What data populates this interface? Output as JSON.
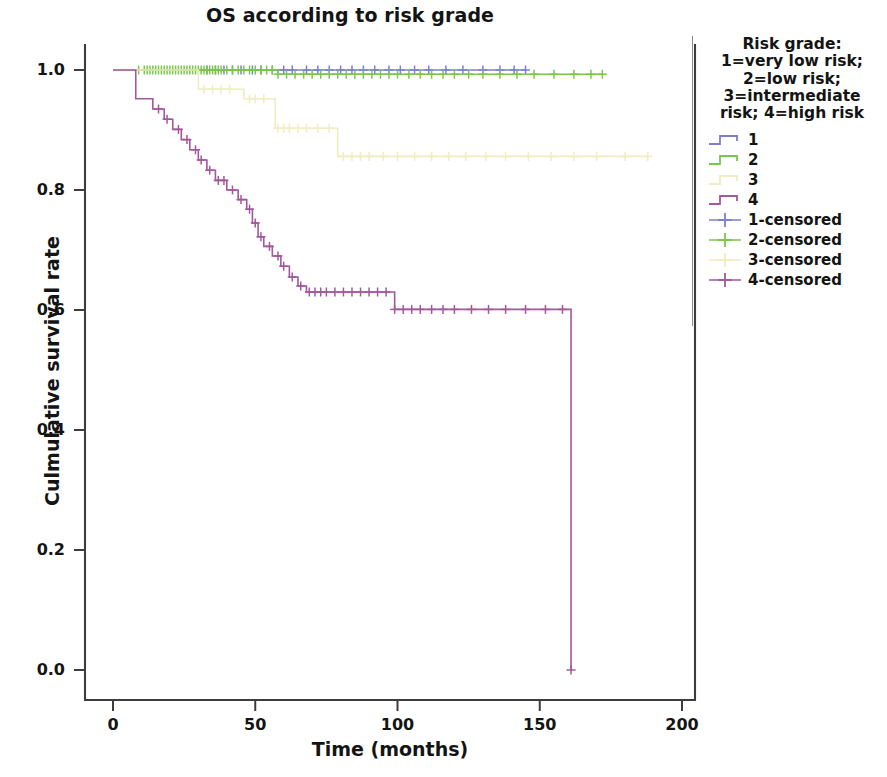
{
  "chart_data": {
    "type": "line",
    "subtype": "kaplan-meier-survival",
    "title": "OS according to risk grade",
    "xlabel": "Time (months)",
    "ylabel": "Culmulative survival rate",
    "xlim": [
      0,
      200
    ],
    "ylim": [
      0.0,
      1.0
    ],
    "xticks": [
      0,
      50,
      100,
      150,
      200
    ],
    "xtick_labels": [
      "0",
      "50",
      "100",
      "150",
      "200"
    ],
    "yticks": [
      0.0,
      0.2,
      0.4,
      0.6,
      0.8,
      1.0
    ],
    "ytick_labels": [
      "0.0",
      "0.2",
      "0.4",
      "0.6",
      "0.8",
      "1.0"
    ],
    "grid": false,
    "legend_position": "right",
    "legend_title": "Risk grade:\n1=very low risk;\n2=low risk;\n3=intermediate\nrisk; 4=high risk",
    "colors": {
      "group1": "#7b7fd0",
      "group2": "#79c64c",
      "group3": "#eeeec0",
      "group4": "#a2589b"
    },
    "series": [
      {
        "name": "1",
        "label": "1",
        "censored_label": "1-censored",
        "color": "#7b7fd0",
        "steps": [
          [
            0,
            1.0
          ],
          [
            145,
            1.0
          ]
        ],
        "censor_times": [
          33,
          36,
          39,
          42,
          45,
          49,
          52,
          56,
          60,
          63,
          68,
          72,
          76,
          80,
          84,
          88,
          92,
          97,
          101,
          106,
          111,
          117,
          123,
          130,
          136,
          141,
          145
        ]
      },
      {
        "name": "2",
        "label": "2",
        "censored_label": "2-censored",
        "color": "#79c64c",
        "steps": [
          [
            0,
            1.0
          ],
          [
            58,
            1.0
          ],
          [
            58,
            0.993
          ],
          [
            172,
            0.993
          ]
        ],
        "censor_times": [
          9,
          11,
          12,
          13,
          14,
          15,
          16,
          17,
          18,
          19,
          20,
          21,
          22,
          23,
          24,
          25,
          26,
          27,
          28,
          29,
          30,
          31,
          32,
          33,
          34,
          35,
          36,
          37,
          38,
          40,
          42,
          44,
          46,
          48,
          50,
          52,
          54,
          56,
          58,
          61,
          64,
          67,
          70,
          73,
          76,
          79,
          82,
          85,
          88,
          91,
          94,
          97,
          100,
          104,
          108,
          112,
          116,
          120,
          125,
          130,
          136,
          142,
          148,
          155,
          162,
          168,
          172
        ]
      },
      {
        "name": "3",
        "label": "3",
        "censored_label": "3-censored",
        "color": "#eeeec0",
        "steps": [
          [
            0,
            1.0
          ],
          [
            30,
            1.0
          ],
          [
            30,
            0.968
          ],
          [
            46,
            0.968
          ],
          [
            46,
            0.952
          ],
          [
            57,
            0.952
          ],
          [
            57,
            0.903
          ],
          [
            79,
            0.903
          ],
          [
            79,
            0.856
          ],
          [
            188,
            0.856
          ]
        ],
        "censor_times": [
          32,
          35,
          38,
          41,
          48,
          50,
          53,
          58,
          60,
          62,
          65,
          68,
          72,
          76,
          81,
          84,
          87,
          90,
          95,
          100,
          106,
          112,
          118,
          124,
          131,
          138,
          146,
          154,
          162,
          170,
          180,
          188
        ]
      },
      {
        "name": "4",
        "label": "4",
        "censored_label": "4-censored",
        "color": "#a2589b",
        "steps": [
          [
            0,
            1.0
          ],
          [
            8,
            1.0
          ],
          [
            8,
            0.952
          ],
          [
            14,
            0.952
          ],
          [
            14,
            0.935
          ],
          [
            18,
            0.935
          ],
          [
            18,
            0.918
          ],
          [
            21,
            0.918
          ],
          [
            21,
            0.901
          ],
          [
            24,
            0.901
          ],
          [
            24,
            0.884
          ],
          [
            27,
            0.884
          ],
          [
            27,
            0.867
          ],
          [
            30,
            0.867
          ],
          [
            30,
            0.85
          ],
          [
            33,
            0.85
          ],
          [
            33,
            0.833
          ],
          [
            36,
            0.833
          ],
          [
            36,
            0.816
          ],
          [
            40,
            0.816
          ],
          [
            40,
            0.8
          ],
          [
            44,
            0.8
          ],
          [
            44,
            0.784
          ],
          [
            47,
            0.784
          ],
          [
            47,
            0.768
          ],
          [
            49,
            0.768
          ],
          [
            49,
            0.745
          ],
          [
            51,
            0.745
          ],
          [
            51,
            0.722
          ],
          [
            53,
            0.722
          ],
          [
            53,
            0.706
          ],
          [
            56,
            0.706
          ],
          [
            56,
            0.69
          ],
          [
            59,
            0.69
          ],
          [
            59,
            0.673
          ],
          [
            62,
            0.673
          ],
          [
            62,
            0.655
          ],
          [
            65,
            0.655
          ],
          [
            65,
            0.64
          ],
          [
            68,
            0.64
          ],
          [
            68,
            0.63
          ],
          [
            99,
            0.63
          ],
          [
            99,
            0.601
          ],
          [
            161,
            0.601
          ],
          [
            161,
            0.0
          ]
        ],
        "censor_times": [
          16,
          19,
          23,
          26,
          29,
          31,
          34,
          37,
          39,
          42,
          45,
          48,
          50,
          52,
          55,
          58,
          60,
          63,
          66,
          69,
          71,
          73,
          75,
          78,
          81,
          84,
          87,
          90,
          93,
          96,
          99,
          102,
          105,
          108,
          112,
          116,
          120,
          126,
          132,
          138,
          145,
          152,
          158,
          161
        ]
      }
    ]
  },
  "legend": {
    "title": "Risk grade:\n1=very low risk;\n2=low risk;\n3=intermediate\nrisk; 4=high risk",
    "entries": [
      {
        "label": "1",
        "color": "#7b7fd0",
        "kind": "step"
      },
      {
        "label": "2",
        "color": "#79c64c",
        "kind": "step"
      },
      {
        "label": "3",
        "color": "#eeeec0",
        "kind": "step"
      },
      {
        "label": "4",
        "color": "#a2589b",
        "kind": "step"
      },
      {
        "label": "1-censored",
        "color": "#7b7fd0",
        "kind": "cross"
      },
      {
        "label": "2-censored",
        "color": "#79c64c",
        "kind": "cross"
      },
      {
        "label": "3-censored",
        "color": "#eeeec0",
        "kind": "cross"
      },
      {
        "label": "4-censored",
        "color": "#a2589b",
        "kind": "cross"
      }
    ]
  },
  "axes": {
    "title": "OS according to risk grade",
    "x_title": "Time (months)",
    "y_title": "Culmulative survival rate"
  }
}
